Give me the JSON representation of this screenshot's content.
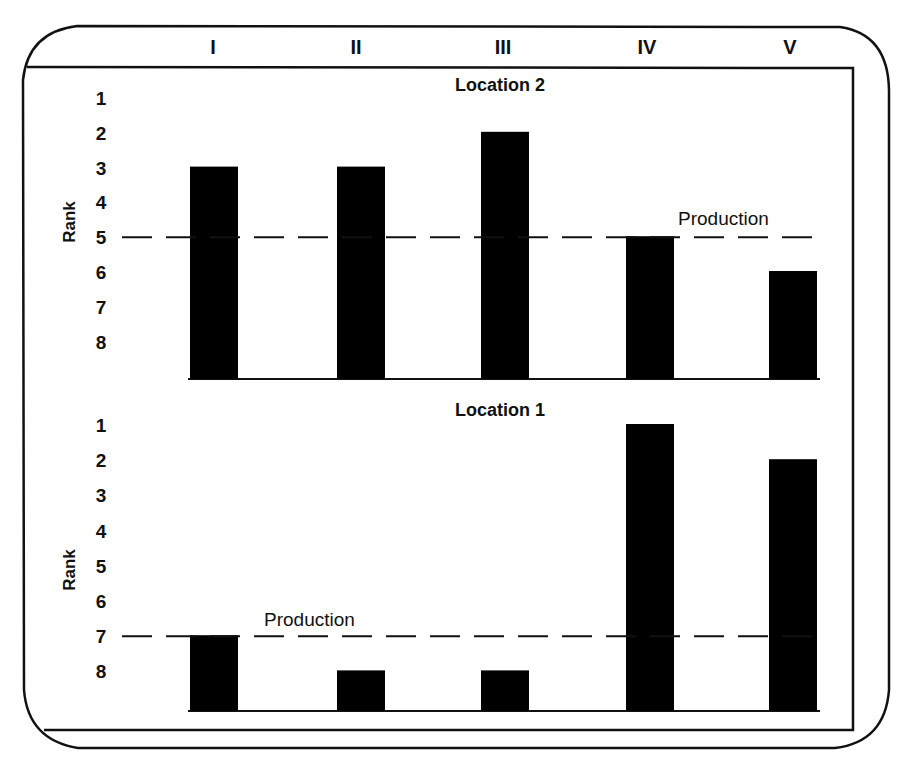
{
  "chart_data": [
    {
      "type": "bar",
      "title": "Location 2",
      "categories": [
        "I",
        "II",
        "III",
        "IV",
        "V"
      ],
      "values": [
        3,
        3,
        2,
        5,
        6
      ],
      "ylabel": "Rank",
      "xlabel": "",
      "y_ticks": [
        "1",
        "2",
        "3",
        "4",
        "5",
        "6",
        "7",
        "8"
      ],
      "ylim": [
        8,
        1
      ],
      "y_inverted": true,
      "grid": false,
      "reference_line": {
        "label": "Production",
        "value": 5,
        "style": "dashed"
      }
    },
    {
      "type": "bar",
      "title": "Location 1",
      "categories": [
        "I",
        "II",
        "III",
        "IV",
        "V"
      ],
      "values": [
        7,
        8,
        8,
        1,
        2
      ],
      "ylabel": "Rank",
      "xlabel": "",
      "y_ticks": [
        "1",
        "2",
        "3",
        "4",
        "5",
        "6",
        "7",
        "8"
      ],
      "ylim": [
        8,
        1
      ],
      "y_inverted": true,
      "grid": false,
      "reference_line": {
        "label": "Production",
        "value": 7,
        "style": "dashed"
      }
    }
  ],
  "header": {
    "categories": [
      "I",
      "II",
      "III",
      "IV",
      "V"
    ]
  },
  "panels": {
    "top": {
      "title": "Location 2",
      "ylabel": "Rank",
      "annotation": "Production"
    },
    "bottom": {
      "title": "Location 1",
      "ylabel": "Rank",
      "annotation": "Production"
    }
  },
  "colors": {
    "bar": "#000000",
    "line": "#111111",
    "background": "#ffffff"
  }
}
